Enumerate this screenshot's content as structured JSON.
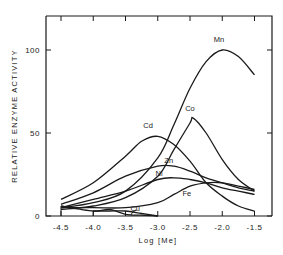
{
  "chart_data": {
    "type": "line",
    "title": "",
    "xlabel": "Log [Me]",
    "ylabel": "RELATIVE ENZYME ACTIVITY",
    "xlim": [
      -4.5,
      -1.5
    ],
    "ylim": [
      0,
      115
    ],
    "x_ticks": [
      "-4.5",
      "-4.0",
      "-3.5",
      "-3.0",
      "-2.5",
      "-2.0",
      "-1.5"
    ],
    "y_ticks": [
      "0",
      "50",
      "100"
    ],
    "grid": false,
    "legend": "inline labels",
    "series": [
      {
        "name": "Mn",
        "x": [
          -4.5,
          -4.0,
          -3.5,
          -3.0,
          -2.75,
          -2.5,
          -2.25,
          -2.0,
          -1.75,
          -1.5
        ],
        "values": [
          5,
          8,
          15,
          35,
          55,
          77,
          93,
          100,
          96,
          85
        ]
      },
      {
        "name": "Co",
        "x": [
          -4.5,
          -4.0,
          -3.5,
          -3.0,
          -2.75,
          -2.5,
          -2.45,
          -2.25,
          -2.0,
          -1.75,
          -1.5
        ],
        "values": [
          4,
          6,
          11,
          24,
          40,
          56,
          59,
          50,
          34,
          22,
          15
        ]
      },
      {
        "name": "Cd",
        "x": [
          -4.5,
          -4.0,
          -3.5,
          -3.25,
          -3.0,
          -2.75,
          -2.5,
          -2.25,
          -2.0,
          -1.75,
          -1.5
        ],
        "values": [
          10,
          20,
          36,
          45,
          48,
          43,
          33,
          20,
          12,
          6,
          3
        ]
      },
      {
        "name": "Zn",
        "x": [
          -4.5,
          -4.0,
          -3.5,
          -3.0,
          -2.75,
          -2.5,
          -2.25,
          -2.0,
          -1.75,
          -1.5
        ],
        "values": [
          7,
          14,
          24,
          30,
          30,
          27,
          23,
          20,
          17,
          15
        ]
      },
      {
        "name": "Ni",
        "x": [
          -4.5,
          -4.0,
          -3.5,
          -3.0,
          -2.75,
          -2.5,
          -2.25,
          -2.0,
          -1.75,
          -1.5
        ],
        "values": [
          5,
          10,
          15,
          22,
          23,
          22,
          20,
          17,
          15,
          13
        ]
      },
      {
        "name": "Fe",
        "x": [
          -4.5,
          -4.0,
          -3.5,
          -3.0,
          -2.75,
          -2.5,
          -2.25,
          -2.0,
          -1.75,
          -1.5
        ],
        "values": [
          5,
          5,
          5,
          8,
          13,
          18,
          20,
          20,
          18,
          16
        ]
      },
      {
        "name": "Cu",
        "x": [
          -4.5,
          -4.0,
          -3.75,
          -3.5,
          -3.25,
          -3.0
        ],
        "values": [
          6,
          3,
          4,
          1,
          0.5,
          0
        ]
      },
      {
        "name": "Cu-baseline",
        "x": [
          -4.0,
          -3.75,
          -3.5,
          -3.25,
          -3.0
        ],
        "values": [
          3,
          3,
          3,
          1.5,
          0
        ]
      }
    ],
    "labels": [
      {
        "text": "Mn",
        "x": -2.05,
        "y": 105
      },
      {
        "text": "Co",
        "x": -2.5,
        "y": 63
      },
      {
        "text": "Cd",
        "x": -3.15,
        "y": 53
      },
      {
        "text": "Zn",
        "x": -2.83,
        "y": 32
      },
      {
        "text": "Ni",
        "x": -2.98,
        "y": 24
      },
      {
        "text": "Fe",
        "x": -2.55,
        "y": 12
      },
      {
        "text": "Cu",
        "x": -3.35,
        "y": 3
      }
    ]
  }
}
